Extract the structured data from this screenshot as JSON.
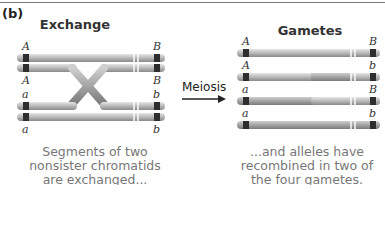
{
  "panel_label": "(b)",
  "left": {
    "title": "Exchange",
    "labels_left": [
      "A",
      "A",
      "a",
      "a"
    ],
    "labels_right": [
      "B",
      "B",
      "b",
      "b"
    ],
    "caption": [
      "Segments of two",
      "nonsister chromatids",
      "are exchanged..."
    ]
  },
  "arrow": {
    "label": "Meiosis"
  },
  "right": {
    "title": "Gametes",
    "gametes": [
      {
        "left": "A",
        "right": "B"
      },
      {
        "left": "A",
        "right": "b"
      },
      {
        "left": "a",
        "right": "B"
      },
      {
        "left": "a",
        "right": "b"
      }
    ],
    "caption": [
      "...and alleles have",
      "recombined in two of",
      "the four gametes."
    ]
  },
  "colors": {
    "chromatid": "#c8c8c8",
    "band": "#333333",
    "caption": "#777777"
  }
}
